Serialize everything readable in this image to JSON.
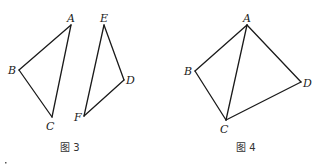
{
  "figures": [
    {
      "caption": "图 3",
      "shapes": [
        {
          "name": "triangle-ABC",
          "vertices": {
            "A": {
              "label": "A",
              "x": 71,
              "y": 25
            },
            "B": {
              "label": "B",
              "x": 19,
              "y": 70
            },
            "C": {
              "label": "C",
              "x": 52,
              "y": 117
            }
          },
          "edges": [
            [
              "A",
              "B"
            ],
            [
              "B",
              "C"
            ],
            [
              "C",
              "A"
            ]
          ]
        },
        {
          "name": "triangle-DEF",
          "vertices": {
            "E": {
              "label": "E",
              "x": 104,
              "y": 25
            },
            "D": {
              "label": "D",
              "x": 124,
              "y": 80
            },
            "F": {
              "label": "F",
              "x": 84,
              "y": 116
            }
          },
          "edges": [
            [
              "E",
              "D"
            ],
            [
              "D",
              "F"
            ],
            [
              "F",
              "E"
            ]
          ]
        }
      ]
    },
    {
      "caption": "图 4",
      "shapes": [
        {
          "name": "quadrilateral-ABCD",
          "vertices": {
            "A": {
              "label": "A",
              "x": 247,
              "y": 25
            },
            "B": {
              "label": "B",
              "x": 195,
              "y": 71
            },
            "C": {
              "label": "C",
              "x": 226,
              "y": 120
            },
            "D": {
              "label": "D",
              "x": 301,
              "y": 82
            }
          },
          "edges": [
            [
              "A",
              "B"
            ],
            [
              "B",
              "C"
            ],
            [
              "C",
              "D"
            ],
            [
              "D",
              "A"
            ],
            [
              "A",
              "C"
            ]
          ]
        }
      ]
    }
  ],
  "labels": {
    "fig3": {
      "A": "A",
      "B": "B",
      "C": "C",
      "E": "E",
      "D": "D",
      "F": "F",
      "caption": "图 3"
    },
    "fig4": {
      "A": "A",
      "B": "B",
      "C": "C",
      "D": "D",
      "caption": "图 4"
    }
  }
}
